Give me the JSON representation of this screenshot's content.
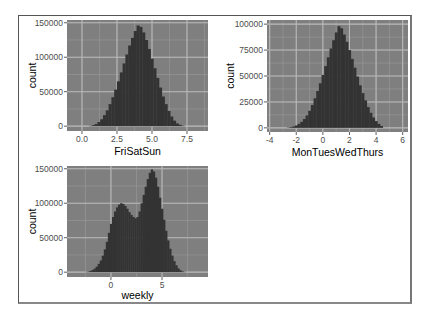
{
  "chart_data": [
    {
      "type": "bar",
      "title": "",
      "xlabel": "FriSatSun",
      "ylabel": "count",
      "xticks": [
        "0.0",
        "2.5",
        "5.0",
        "7.5"
      ],
      "xtick_values": [
        0,
        2.5,
        5,
        7.5
      ],
      "yticks": [
        "0",
        "50000",
        "100000",
        "150000"
      ],
      "ytick_values": [
        0,
        50000,
        100000,
        150000
      ],
      "xlim": [
        -1.07,
        9.0
      ],
      "ylim": [
        -7000,
        154000
      ],
      "grid": true,
      "bins": {
        "x": [
          0.6,
          0.8,
          1.0,
          1.2,
          1.4,
          1.6,
          1.8,
          2.0,
          2.2,
          2.4,
          2.6,
          2.8,
          3.0,
          3.2,
          3.4,
          3.6,
          3.8,
          4.0,
          4.2,
          4.4,
          4.6,
          4.8,
          5.0,
          5.2,
          5.4,
          5.6,
          5.8,
          6.0,
          6.2,
          6.4,
          6.6,
          6.8,
          7.0,
          7.2
        ],
        "width": 0.2,
        "counts": [
          500,
          1500,
          3000,
          6000,
          10000,
          16000,
          23000,
          32000,
          42000,
          53000,
          65000,
          78000,
          91000,
          104000,
          117000,
          128000,
          138000,
          146000,
          144000,
          136000,
          125000,
          112000,
          98000,
          84000,
          70000,
          56000,
          43000,
          32000,
          22000,
          14000,
          8000,
          4000,
          2000,
          800
        ]
      }
    },
    {
      "type": "bar",
      "title": "",
      "xlabel": "MonTuesWedThurs",
      "ylabel": "count",
      "xticks": [
        "-4",
        "-2",
        "0",
        "2",
        "4",
        "6"
      ],
      "xtick_values": [
        -4,
        -2,
        0,
        2,
        4,
        6
      ],
      "yticks": [
        "0",
        "25000",
        "50000",
        "75000",
        "100000"
      ],
      "ytick_values": [
        0,
        25000,
        50000,
        75000,
        100000
      ],
      "xlim": [
        -4.2,
        6.4
      ],
      "ylim": [
        -4000,
        104000
      ],
      "grid": true,
      "bins": {
        "x": [
          -2.6,
          -2.4,
          -2.2,
          -2.0,
          -1.8,
          -1.6,
          -1.4,
          -1.2,
          -1.0,
          -0.8,
          -0.6,
          -0.4,
          -0.2,
          0.0,
          0.2,
          0.4,
          0.6,
          0.8,
          1.0,
          1.2,
          1.4,
          1.6,
          1.8,
          2.0,
          2.2,
          2.4,
          2.6,
          2.8,
          3.0,
          3.2,
          3.4,
          3.6,
          3.8,
          4.0,
          4.2,
          4.4
        ],
        "width": 0.2,
        "counts": [
          300,
          700,
          1300,
          2300,
          3800,
          5800,
          8500,
          12000,
          16500,
          22000,
          28500,
          35500,
          43000,
          51000,
          59500,
          68000,
          76500,
          84500,
          92000,
          98000,
          96000,
          90000,
          83000,
          75000,
          66500,
          58000,
          49500,
          41000,
          33500,
          26500,
          20000,
          14500,
          10000,
          6500,
          3800,
          1800
        ]
      }
    },
    {
      "type": "bar",
      "title": "",
      "xlabel": "weekly",
      "ylabel": "count",
      "xticks": [
        "0",
        "5"
      ],
      "xtick_values": [
        0,
        5
      ],
      "yticks": [
        "0",
        "50000",
        "100000",
        "150000"
      ],
      "ytick_values": [
        0,
        50000,
        100000,
        150000
      ],
      "xlim": [
        -4.3,
        9.5
      ],
      "ylim": [
        -7000,
        154000
      ],
      "grid": true,
      "bins": {
        "x": [
          -2.4,
          -2.2,
          -2.0,
          -1.8,
          -1.6,
          -1.4,
          -1.2,
          -1.0,
          -0.8,
          -0.6,
          -0.4,
          -0.2,
          0.0,
          0.2,
          0.4,
          0.6,
          0.8,
          1.0,
          1.2,
          1.4,
          1.6,
          1.8,
          2.0,
          2.2,
          2.4,
          2.6,
          2.8,
          3.0,
          3.2,
          3.4,
          3.6,
          3.8,
          4.0,
          4.2,
          4.4,
          4.6,
          4.8,
          5.0,
          5.2,
          5.4,
          5.6,
          5.8,
          6.0,
          6.2,
          6.4,
          6.6,
          6.8,
          7.0,
          7.2
        ],
        "width": 0.2,
        "counts": [
          400,
          900,
          1800,
          3200,
          5200,
          8000,
          12000,
          17000,
          24000,
          33000,
          44000,
          57000,
          70000,
          80000,
          88000,
          94000,
          98000,
          100000,
          99000,
          96000,
          92000,
          87000,
          83000,
          80000,
          78000,
          80000,
          88000,
          100000,
          112000,
          124000,
          135000,
          144000,
          149000,
          146000,
          137000,
          124000,
          108000,
          92000,
          76000,
          60000,
          46000,
          34000,
          24000,
          16000,
          10000,
          5500,
          2800,
          1200,
          500
        ]
      }
    }
  ],
  "colors": {
    "panel_bg": "#7f7f7f",
    "grid_major": "#b8b8b8",
    "grid_minor": "#9a9a9a",
    "bar_fill": "#333333",
    "tick_text": "#4d4d4d",
    "title_text": "#000000"
  }
}
